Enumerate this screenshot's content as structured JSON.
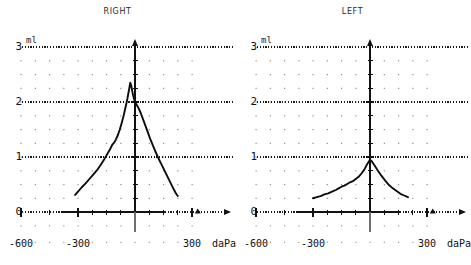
{
  "panels": [
    {
      "title": "RIGHT",
      "unit": "ml"
    },
    {
      "title": "LEFT",
      "unit": "ml"
    }
  ],
  "axis": {
    "y_ticks": [
      "0",
      "1",
      "2",
      "3"
    ],
    "x_ticks": [
      "-600",
      "-300",
      "300"
    ],
    "x_unit": "daPa",
    "y_unit": "ml"
  },
  "chart_data": [
    {
      "type": "line",
      "title": "RIGHT",
      "xlabel": "daPa",
      "ylabel": "ml",
      "xlim": [
        -650,
        360
      ],
      "ylim": [
        0,
        3
      ],
      "grid": true,
      "gridlines_y": [
        1,
        2,
        3
      ],
      "xticks": [
        -600,
        -300,
        0,
        300
      ],
      "yticks": [
        0,
        1,
        2,
        3
      ],
      "peak": {
        "x": -25,
        "y": 2.35
      },
      "x": [
        -315,
        -300,
        -280,
        -260,
        -240,
        -220,
        -200,
        -180,
        -160,
        -145,
        -130,
        -120,
        -110,
        -100,
        -90,
        -80,
        -70,
        -60,
        -50,
        -40,
        -30,
        -25,
        -20,
        -10,
        0,
        10,
        20,
        30,
        45,
        60,
        80,
        100,
        120,
        140,
        160,
        180,
        200,
        215,
        225
      ],
      "y": [
        0.31,
        0.37,
        0.45,
        0.52,
        0.6,
        0.68,
        0.76,
        0.86,
        0.97,
        1.06,
        1.15,
        1.22,
        1.26,
        1.32,
        1.4,
        1.5,
        1.62,
        1.75,
        1.9,
        2.06,
        2.25,
        2.35,
        2.3,
        2.12,
        2.0,
        1.94,
        1.88,
        1.8,
        1.66,
        1.52,
        1.33,
        1.16,
        1.0,
        0.86,
        0.72,
        0.58,
        0.44,
        0.34,
        0.29
      ]
    },
    {
      "type": "line",
      "title": "LEFT",
      "xlabel": "daPa",
      "ylabel": "ml",
      "xlim": [
        -650,
        360
      ],
      "ylim": [
        0,
        3
      ],
      "grid": true,
      "gridlines_y": [
        1,
        2,
        3
      ],
      "xticks": [
        -600,
        -300,
        0,
        300
      ],
      "yticks": [
        0,
        1,
        2,
        3
      ],
      "peak": {
        "x": 0,
        "y": 0.95
      },
      "x": [
        -300,
        -280,
        -260,
        -240,
        -220,
        -200,
        -180,
        -165,
        -150,
        -135,
        -120,
        -105,
        -90,
        -75,
        -60,
        -45,
        -30,
        -15,
        0,
        10,
        25,
        40,
        60,
        80,
        100,
        120,
        140,
        160,
        180,
        200
      ],
      "y": [
        0.25,
        0.27,
        0.29,
        0.32,
        0.34,
        0.37,
        0.4,
        0.43,
        0.46,
        0.48,
        0.51,
        0.54,
        0.56,
        0.6,
        0.64,
        0.7,
        0.77,
        0.87,
        0.95,
        0.92,
        0.84,
        0.76,
        0.66,
        0.57,
        0.49,
        0.43,
        0.38,
        0.33,
        0.3,
        0.27
      ]
    }
  ]
}
